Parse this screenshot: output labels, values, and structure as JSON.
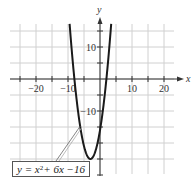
{
  "chart_data": {
    "type": "line",
    "title": "",
    "function": "y = x^2 + 6x - 16",
    "equation_label": {
      "prefix": "y = x",
      "exponent": "2",
      "suffix": " + 6x −16"
    },
    "xlabel": "x",
    "ylabel": "y",
    "xlim": [
      -25,
      23
    ],
    "ylim": [
      -30,
      17
    ],
    "x_ticks": [
      -25,
      -20,
      -15,
      -10,
      -5,
      5,
      10,
      15,
      20
    ],
    "x_tick_labels": [
      {
        "value": -20,
        "label": "−20"
      },
      {
        "value": -10,
        "label": "−10"
      },
      {
        "value": 10,
        "label": "10"
      },
      {
        "value": 20,
        "label": "20"
      }
    ],
    "y_ticks": [
      15,
      10,
      5,
      -5,
      -10,
      -15,
      -20,
      -25,
      -30
    ],
    "y_tick_labels": [
      {
        "value": 10,
        "label": "10"
      },
      {
        "value": -10,
        "label": "−10"
      }
    ],
    "grid": true,
    "grid_step": 5,
    "vertex": {
      "x": -3,
      "y": -25
    },
    "x_intercepts": [
      -8,
      2
    ],
    "y_intercept": -16,
    "series": [
      {
        "name": "y = x^2 + 6x - 16",
        "x": [
          -9.5,
          -9,
          -8,
          -7,
          -6,
          -5,
          -4,
          -3,
          -2,
          -1,
          0,
          1,
          2,
          3,
          3.5
        ],
        "y": [
          17.25,
          11,
          0,
          -9,
          -16,
          -21,
          -24,
          -25,
          -24,
          -21,
          -16,
          -9,
          0,
          11,
          17.25
        ]
      }
    ]
  },
  "colors": {
    "curve": "#1a1a1a",
    "grid": "#d0d0d0",
    "axis": "#333333",
    "background": "#ffffff"
  }
}
